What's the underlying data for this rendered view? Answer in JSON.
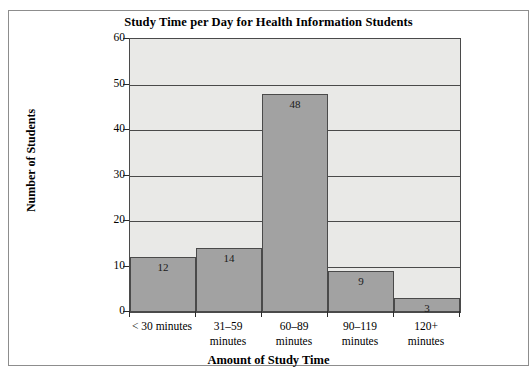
{
  "chart_data": {
    "type": "bar",
    "title": "Study Time per Day for Health Information Students",
    "xlabel": "Amount of Study Time",
    "ylabel": "Number of Students",
    "categories": [
      "< 30 minutes",
      "31–59 minutes",
      "60–89 minutes",
      "90–119 minutes",
      "120+ minutes"
    ],
    "category_lines": [
      [
        "< 30 minutes"
      ],
      [
        "31–59",
        "minutes"
      ],
      [
        "60–89",
        "minutes"
      ],
      [
        "90–119",
        "minutes"
      ],
      [
        "120+",
        "minutes"
      ]
    ],
    "values": [
      12,
      14,
      48,
      9,
      3
    ],
    "value_labels": [
      "12",
      "14",
      "48",
      "9",
      "3"
    ],
    "ylim": [
      0,
      60
    ],
    "yticks": [
      0,
      10,
      20,
      30,
      40,
      50,
      60
    ],
    "ytick_labels": [
      "0",
      "10",
      "20",
      "30",
      "40",
      "50",
      "60"
    ],
    "grid": true,
    "legend": "none",
    "colors": {
      "bar_fill": "#a2a2a2",
      "bar_edge": "#4a4a4a",
      "plot_background": "#e9e9e7",
      "gridline": "#4a4a4a",
      "frame_border": "#8d8d8d",
      "text": "#000000"
    }
  }
}
